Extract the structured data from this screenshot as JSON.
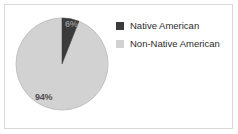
{
  "chart_data": {
    "type": "pie",
    "title": "",
    "categories": [
      "Native American",
      "Non-Native American"
    ],
    "values": [
      6,
      94
    ],
    "labels": [
      "6%",
      "94%"
    ],
    "colors": [
      "#3b3b3b",
      "#d2d2d2"
    ],
    "legend_position": "right",
    "grid": false,
    "units": "percent"
  },
  "frame": {
    "border_color": "#d8d8d8",
    "background": "#ffffff"
  },
  "pie": {
    "slices": [
      {
        "name": "Native American",
        "value": 6,
        "label": "6%",
        "color": "#3b3b3b"
      },
      {
        "name": "Non-Native American",
        "value": 94,
        "label": "94%",
        "color": "#d2d2d2"
      }
    ],
    "label_minor": "6%",
    "label_major": "94%",
    "outline_color": "#bdbdbd"
  },
  "legend": {
    "items": [
      {
        "label": "Native American",
        "color": "#3b3b3b"
      },
      {
        "label": "Non-Native American",
        "color": "#d2d2d2"
      }
    ]
  }
}
